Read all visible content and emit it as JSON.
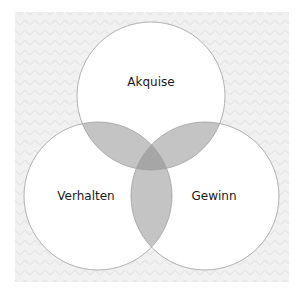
{
  "diagram": {
    "type": "venn-3",
    "background_color": "#efefef",
    "circle_fill": "#ffffff",
    "circle_stroke": "#a8a8a8",
    "pair_overlap_color": "#c4c4c4",
    "triple_overlap_color": "#a6a6a6",
    "circles": [
      {
        "id": "akquise",
        "label": "Akquise",
        "cx": 151,
        "cy": 96,
        "r": 74
      },
      {
        "id": "verhalten",
        "label": "Verhalten",
        "cx": 98,
        "cy": 196,
        "r": 74
      },
      {
        "id": "gewinn",
        "label": "Gewinn",
        "cx": 205,
        "cy": 196,
        "r": 74
      }
    ]
  }
}
